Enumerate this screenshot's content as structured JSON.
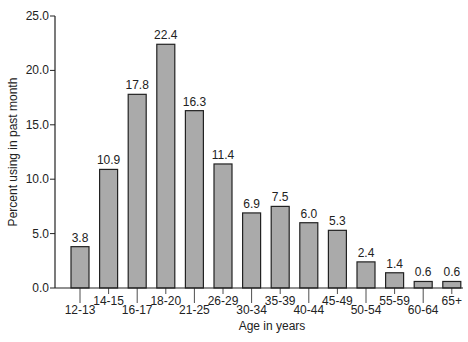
{
  "chart_data": {
    "type": "bar",
    "title": "",
    "xlabel": "Age in years",
    "ylabel": "Percent using in past month",
    "ylim": [
      0,
      25
    ],
    "yticks": [
      "0.0",
      "5.0",
      "10.0",
      "15.0",
      "20.0",
      "25.0"
    ],
    "categories": [
      "12-13",
      "14-15",
      "16-17",
      "18-20",
      "21-25",
      "26-29",
      "30-34",
      "35-39",
      "40-44",
      "45-49",
      "50-54",
      "55-59",
      "60-64",
      "65+"
    ],
    "values": [
      3.8,
      10.9,
      17.8,
      22.4,
      16.3,
      11.4,
      6.9,
      7.5,
      6.0,
      5.3,
      2.4,
      1.4,
      0.6,
      0.6
    ],
    "value_labels": [
      "3.8",
      "10.9",
      "17.8",
      "22.4",
      "16.3",
      "11.4",
      "6.9",
      "7.5",
      "6.0",
      "5.3",
      "2.4",
      "1.4",
      "0.6",
      "0.6"
    ],
    "grid": false,
    "legend": null,
    "bar_color": "#aaaaaa",
    "bar_edge_color": "#222222"
  }
}
